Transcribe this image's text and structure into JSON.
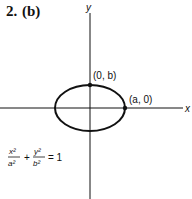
{
  "problem": {
    "number": "2.",
    "part": "(b)"
  },
  "axes": {
    "x_label": "x",
    "y_label": "y"
  },
  "points": [
    {
      "label": "(0, b)",
      "cx": 90,
      "cy": 85
    },
    {
      "label": "(a, 0)",
      "cx": 125,
      "cy": 108
    }
  ],
  "equation": {
    "x_num": "x²",
    "x_den": "a²",
    "plus": "+",
    "y_num": "y²",
    "y_den": "b²",
    "rhs": "= 1"
  },
  "ellipse": {
    "cx": 90,
    "cy": 108,
    "rx": 35,
    "ry": 23,
    "color": "#111111"
  }
}
